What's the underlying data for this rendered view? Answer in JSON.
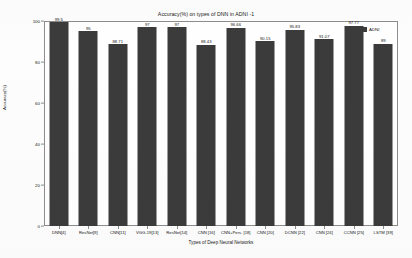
{
  "chart_data": {
    "type": "bar",
    "title": "Accuracy(%) on types of DNN in ADNI -1",
    "xlabel": "Types of Deep Neural Networks",
    "ylabel": "Accuracy(%)",
    "ylim": [
      0,
      100
    ],
    "yticks": [
      0,
      20,
      40,
      60,
      80,
      100
    ],
    "ytick_labels": [
      "0",
      "20",
      "40",
      "60",
      "80",
      "100"
    ],
    "grid": false,
    "legend_position": "top-right",
    "legend": [
      "ADNI"
    ],
    "bar_color": "#3b3b3b",
    "categories": [
      "DNN[4]",
      "ResNet[9]",
      "CNN[11]",
      "VGG-19[13]",
      "ResNet[14]",
      "CNN [16]",
      "CNN+Pers. [18]",
      "CNN [20]",
      "DCNN [22]",
      "CNN [24]",
      "CCNN [25]",
      "LSTM [39]"
    ],
    "values": [
      99.5,
      95,
      88.71,
      97,
      97,
      88.43,
      96.66,
      90.15,
      95.83,
      91.07,
      97.77,
      89
    ],
    "value_labels": [
      "99.5",
      "95",
      "88.71",
      "97",
      "97",
      "88.43",
      "96.66",
      "90.15",
      "95.83",
      "91.07",
      "97.77",
      "89"
    ],
    "series": [
      {
        "name": "ADNI",
        "values": [
          99.5,
          95,
          88.71,
          97,
          97,
          88.43,
          96.66,
          90.15,
          95.83,
          91.07,
          97.77,
          89
        ]
      }
    ]
  },
  "legend": {
    "label": "ADNI"
  }
}
